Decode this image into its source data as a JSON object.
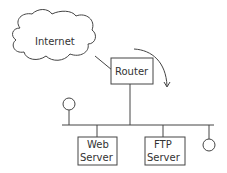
{
  "diagram": {
    "nodes": {
      "internet": {
        "label": "Internet"
      },
      "router": {
        "label": "Router"
      },
      "web_server": {
        "label_line1": "Web",
        "label_line2": "Server"
      },
      "ftp_server": {
        "label_line1": "FTP",
        "label_line2": "Server"
      }
    },
    "colors": {
      "stroke": "#444444",
      "background": "#ffffff"
    }
  }
}
